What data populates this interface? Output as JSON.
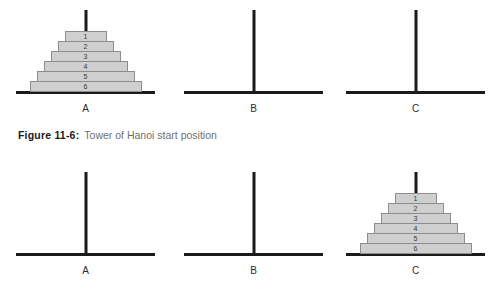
{
  "figure": {
    "caption_label": "Figure 11-6:",
    "caption_text": "Tower of Hanoi start position",
    "colors": {
      "disc_fill": "#cfcfcf",
      "disc_border": "#8d8d8d",
      "rod": "#1b1b1b",
      "base": "#1b1b1b",
      "label": "#2b2b2b",
      "caption_label": "#1a1a1a",
      "caption_text": "#6f6f6f",
      "background": "#ffffff"
    }
  },
  "rows": [
    {
      "name": "start-position",
      "pegs": [
        {
          "label": "A",
          "discs": [
            {
              "number": "1",
              "width": 42
            },
            {
              "number": "2",
              "width": 56
            },
            {
              "number": "3",
              "width": 70
            },
            {
              "number": "4",
              "width": 84
            },
            {
              "number": "5",
              "width": 98
            },
            {
              "number": "6",
              "width": 112
            }
          ]
        },
        {
          "label": "B",
          "discs": []
        },
        {
          "label": "C",
          "discs": []
        }
      ]
    },
    {
      "name": "goal-position",
      "pegs": [
        {
          "label": "A",
          "discs": []
        },
        {
          "label": "B",
          "discs": []
        },
        {
          "label": "C",
          "discs": [
            {
              "number": "1",
              "width": 42
            },
            {
              "number": "2",
              "width": 56
            },
            {
              "number": "3",
              "width": 70
            },
            {
              "number": "4",
              "width": 84
            },
            {
              "number": "5",
              "width": 98
            },
            {
              "number": "6",
              "width": 112
            }
          ]
        }
      ]
    }
  ]
}
